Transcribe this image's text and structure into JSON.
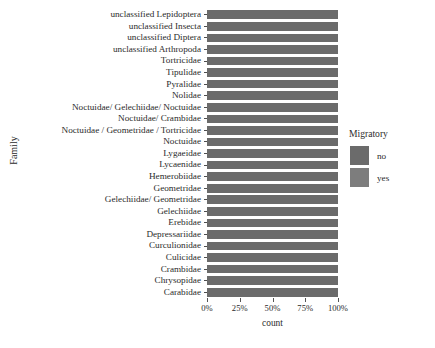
{
  "chart_data": {
    "type": "bar",
    "orientation": "horizontal",
    "stacked": true,
    "normalized": true,
    "title": "",
    "xlabel": "count",
    "ylabel": "Family",
    "xlim": [
      0,
      100
    ],
    "xticks": [
      0,
      25,
      50,
      75,
      100
    ],
    "xticklabels": [
      "0%",
      "25%",
      "50%",
      "75%",
      "100%"
    ],
    "grid": false,
    "legend": {
      "title": "Migratory",
      "position": "right",
      "entries": [
        {
          "label": "no",
          "color": "#6b6b6b"
        },
        {
          "label": "yes",
          "color": "#7d7d7d"
        }
      ]
    },
    "categories": [
      "unclassified Lepidoptera",
      "unclassified Insecta",
      "unclassified Diptera",
      "unclassified Arthropoda",
      "Tortricidae",
      "Tipulidae",
      "Pyralidae",
      "Nolidae",
      "Noctuidae/ Gelechiidae/ Noctuidae",
      "Noctuidae/ Crambidae",
      "Noctuidae / Geometridae / Tortricidae",
      "Noctuidae",
      "Lygaeidae",
      "Lycaenidae",
      "Hemerobiidae",
      "Geometridae",
      "Gelechiidae/ Geometridae",
      "Gelechiidae",
      "Erebidae",
      "Depressariidae",
      "Curculionidae",
      "Culicidae",
      "Crambidae",
      "Chrysopidae",
      "Carabidae"
    ],
    "series": [
      {
        "name": "no",
        "color": "#6b6b6b",
        "values": [
          100,
          100,
          100,
          100,
          100,
          100,
          100,
          100,
          100,
          100,
          100,
          100,
          100,
          100,
          100,
          100,
          100,
          100,
          100,
          100,
          100,
          100,
          100,
          100,
          100
        ]
      },
      {
        "name": "yes",
        "color": "#7d7d7d",
        "values": [
          0,
          0,
          0,
          0,
          0,
          0,
          0,
          0,
          0,
          0,
          0,
          0,
          0,
          0,
          0,
          0,
          0,
          0,
          0,
          0,
          0,
          0,
          0,
          0,
          0
        ]
      }
    ]
  }
}
